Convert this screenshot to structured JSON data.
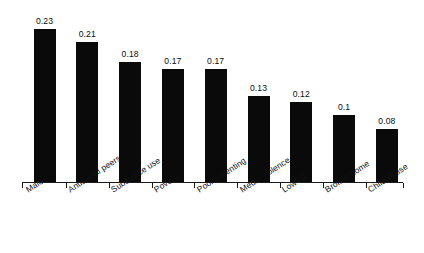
{
  "chart_data": {
    "type": "bar",
    "title": "",
    "subtitle": "",
    "xlabel": "",
    "ylabel": "",
    "categories": [
      "Male",
      "Antisocial peers",
      "Substance use",
      "Poverty",
      "Poor parenting",
      "Media violence",
      "Low IQ",
      "Broken home",
      "Child abuse"
    ],
    "values": [
      0.23,
      0.21,
      0.18,
      0.17,
      0.17,
      0.13,
      0.12,
      0.1,
      0.08
    ],
    "value_labels": [
      "0.23",
      "0.21",
      "0.18",
      "0.17",
      "0.17",
      "0.13",
      "0.12",
      "0.1",
      "0.08"
    ],
    "ylim": [
      0,
      0.23
    ],
    "grid": false,
    "legend": null,
    "legend_position": "none",
    "bar_color": "#0a0a0a",
    "axis_color": "#1a1a1a",
    "background_color": "#ffffff",
    "label_rotation_deg": -33,
    "y_axis_visible": false,
    "x_axis_visible": true,
    "tick_marks": true,
    "data_labels_shown": true
  }
}
